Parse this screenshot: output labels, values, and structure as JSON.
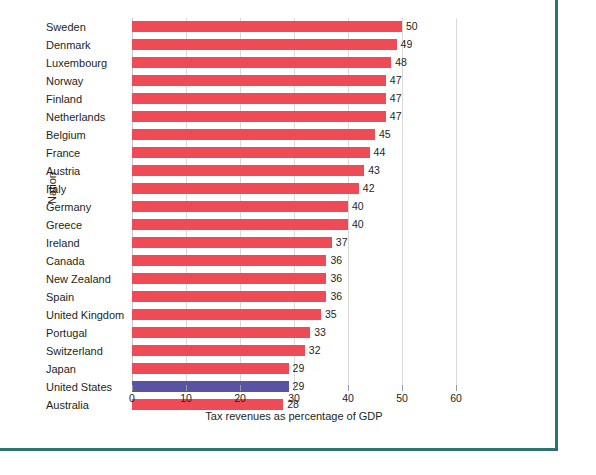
{
  "chart_data": {
    "type": "bar",
    "orientation": "horizontal",
    "title": "",
    "xlabel": "Tax revenues as percentage of GDP",
    "ylabel": "Nation",
    "xlim": [
      0,
      60
    ],
    "xticks": [
      0,
      10,
      20,
      30,
      40,
      50,
      60
    ],
    "grid": "vertical",
    "legend": "none",
    "categories": [
      "Sweden",
      "Denmark",
      "Luxembourg",
      "Norway",
      "Finland",
      "Netherlands",
      "Belgium",
      "France",
      "Austria",
      "Italy",
      "Germany",
      "Greece",
      "Ireland",
      "Canada",
      "New Zealand",
      "Spain",
      "United Kingdom",
      "Portugal",
      "Switzerland",
      "Japan",
      "United States",
      "Australia"
    ],
    "values": [
      50,
      49,
      48,
      47,
      47,
      47,
      45,
      44,
      43,
      42,
      40,
      40,
      37,
      36,
      36,
      36,
      35,
      33,
      32,
      29,
      29,
      28
    ],
    "data_labels": [
      "50",
      "49",
      "48",
      "47",
      "47",
      "47",
      "45",
      "44",
      "43",
      "42",
      "40",
      "40",
      "37",
      "36",
      "36",
      "36",
      "35",
      "33",
      "32",
      "29",
      "29",
      "28"
    ],
    "highlight_category": "United States",
    "colors": {
      "bar": "#ef4b57",
      "bar_highlight": "#5a53a3",
      "grid": "#d9d9d9",
      "text": "#231f20",
      "frame": "#2c7470"
    }
  }
}
